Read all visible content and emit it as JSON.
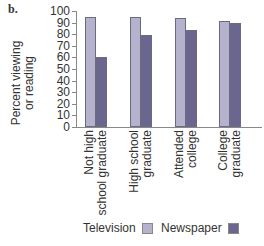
{
  "panel_label": "b.",
  "chart_data": {
    "type": "bar",
    "title": "",
    "xlabel": "",
    "ylabel": "Percent viewing or reading",
    "ylim": [
      0,
      100
    ],
    "yticks": [
      0,
      10,
      20,
      30,
      40,
      50,
      60,
      70,
      80,
      90,
      100
    ],
    "grid": false,
    "legend_position": "bottom",
    "categories": [
      "Not high school graduate",
      "High school graduate",
      "Attended college",
      "College graduate"
    ],
    "category_lines": [
      [
        "Not high",
        "school graduate"
      ],
      [
        "High school",
        "graduate"
      ],
      [
        "Attended",
        "college"
      ],
      [
        "College",
        "graduate"
      ]
    ],
    "series": [
      {
        "name": "Television",
        "color": "#b4b2cc",
        "values": [
          95,
          95,
          94,
          91
        ]
      },
      {
        "name": "Newspaper",
        "color": "#6a6690",
        "values": [
          60,
          79,
          84,
          90
        ]
      }
    ]
  },
  "ylabel_lines": [
    "Percent viewing",
    "or reading"
  ],
  "legend": {
    "items": [
      {
        "label": "Television"
      },
      {
        "label": "Newspaper"
      }
    ]
  }
}
